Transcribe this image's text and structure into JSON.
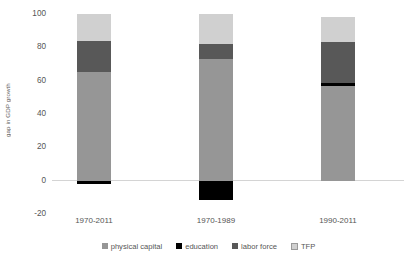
{
  "chart_data": {
    "type": "bar",
    "subtype": "stacked-bar-with-negatives",
    "title": "",
    "xlabel": "",
    "ylabel": "gap in GDP growth",
    "categories": [
      "1970-2011",
      "1970-1989",
      "1990-2011"
    ],
    "series": [
      {
        "name": "physical capital",
        "color": "#969696",
        "values": [
          65,
          73,
          57
        ]
      },
      {
        "name": "education",
        "color": "#000000",
        "values": [
          -2,
          -11.5,
          1.5
        ]
      },
      {
        "name": "labor force",
        "color": "#585858",
        "values": [
          19,
          9,
          25
        ]
      },
      {
        "name": "TFP",
        "color": "#d0d0d0",
        "values": [
          16,
          18,
          15
        ]
      }
    ],
    "stacked_totals": [
      100,
      100,
      98
    ],
    "ylim": [
      -20,
      100
    ],
    "yticks": [
      100,
      80,
      60,
      40,
      20,
      0,
      -20
    ],
    "ytick_labels": [
      "100",
      "80",
      "60",
      "40",
      "20",
      "0",
      "-20"
    ],
    "grid": false,
    "zero_line": true,
    "legend_position": "bottom"
  },
  "axis": {
    "y_title": "gap in GDP growth",
    "y_ticks": [
      "100",
      "80",
      "60",
      "40",
      "20",
      "0",
      "-20"
    ]
  },
  "categories": [
    {
      "label": "1970-2011"
    },
    {
      "label": "1970-1989"
    },
    {
      "label": "1990-2011"
    }
  ],
  "legend": {
    "items": [
      {
        "label": "physical capital",
        "color": "#969696"
      },
      {
        "label": "education",
        "color": "#000000"
      },
      {
        "label": "labor force",
        "color": "#585858"
      },
      {
        "label": "TFP",
        "color": "#d0d0d0"
      }
    ]
  },
  "colors": {
    "physical_capital": "#969696",
    "education": "#000000",
    "labor_force": "#585858",
    "tfp": "#d0d0d0",
    "zero_line": "#d4d4d4",
    "text": "#555555",
    "background": "#ffffff"
  }
}
